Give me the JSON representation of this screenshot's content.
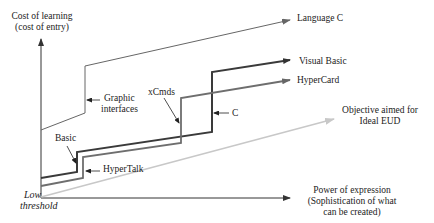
{
  "diagram": {
    "type": "learning-curve",
    "axes": {
      "y_label_line1": "Cost of learning",
      "y_label_line2": "(cost of entry)",
      "x_label_line1": "Power of expression",
      "x_label_line2": "(Sophistication of what",
      "x_label_line3": "can be created)",
      "origin_label_line1": "Low",
      "origin_label_line2": "threshold"
    },
    "curves": [
      {
        "name": "Language C",
        "color": "#666666"
      },
      {
        "name": "Visual Basic",
        "color": "#3a3a3a"
      },
      {
        "name": "HyperCard",
        "color": "#6e6e6e"
      },
      {
        "name": "Objective aimed for Ideal EUD",
        "color": "#c8c8c8"
      }
    ],
    "labels": {
      "language_c": "Language C",
      "visual_basic": "Visual Basic",
      "hypercard": "HyperCard",
      "objective_line1": "Objective aimed for",
      "objective_line2": "Ideal EUD",
      "graphic_interfaces_line1": "Graphic",
      "graphic_interfaces_line2": "interfaces",
      "xcmds": "xCmds",
      "c": "C",
      "basic": "Basic",
      "hypertalk": "HyperTalk"
    }
  }
}
